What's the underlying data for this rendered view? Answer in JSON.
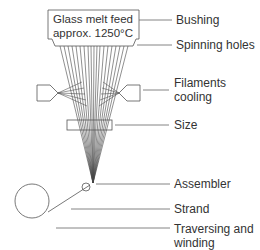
{
  "diagram": {
    "bushing_text": {
      "line1": "Glass melt feed",
      "line2": "approx. 1250°C"
    },
    "labels": [
      {
        "id": "bushing",
        "text": "Bushing"
      },
      {
        "id": "spinning-holes",
        "text": "Spinning holes"
      },
      {
        "id": "filaments-cooling",
        "line1": "Filaments",
        "line2": "cooling"
      },
      {
        "id": "size",
        "text": "Size"
      },
      {
        "id": "assembler",
        "text": "Assembler"
      },
      {
        "id": "strand",
        "text": "Strand"
      },
      {
        "id": "traversing-winding",
        "line1": "Traversing and",
        "line2": "winding"
      }
    ],
    "colors": {
      "line": "#555555",
      "text": "#333333"
    }
  }
}
